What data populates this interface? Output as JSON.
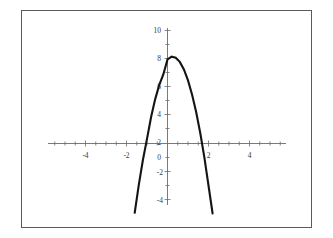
{
  "figure": {
    "background_color": "#ffffff",
    "frame_color": "#5a5a5a",
    "axis_color": "#6b6b6b",
    "curve_color": "#141414",
    "label_color": "#3a3a3a"
  },
  "chart_data": {
    "type": "line",
    "title": "",
    "subtitle": "",
    "xlabel": "",
    "ylabel": "",
    "grid": false,
    "legend": null,
    "legend_position": "none",
    "xlim": [
      -5.8,
      5.8
    ],
    "ylim": [
      -5.4,
      10.6
    ],
    "xticks": [
      -4,
      -2,
      2,
      4
    ],
    "xtick_labels": [
      "-4",
      "-2",
      "2",
      "4"
    ],
    "yticks": [
      -4,
      -2,
      2,
      4,
      6,
      8,
      10
    ],
    "ytick_labels": [
      "-4",
      "-2",
      "2",
      "4",
      "6",
      "8",
      "10"
    ],
    "origin_label": "0",
    "minor_ticks": true,
    "annotations": [],
    "series": [
      {
        "name": "parabola",
        "kind": "quadratic",
        "equation": "y = -3(x - 0.25)^2 + 6.2",
        "vertex": [
          0.25,
          6.2
        ],
        "x_intercepts": [
          -1.19,
          1.69
        ],
        "y_intercept": 6.01,
        "x_domain": [
          -1.6,
          2.2
        ],
        "y_range": [
          -5.0,
          6.2
        ],
        "x": [
          -1.6,
          -1.4,
          -1.2,
          -1.0,
          -0.8,
          -0.6,
          -0.4,
          -0.2,
          0.0,
          0.2,
          0.4,
          0.6,
          0.8,
          1.0,
          1.2,
          1.4,
          1.6,
          1.8,
          2.0,
          2.2
        ],
        "y": [
          -4.95,
          -2.96,
          -1.18,
          0.33,
          1.89,
          3.17,
          4.19,
          4.95,
          6.01,
          6.2,
          6.13,
          5.83,
          5.29,
          4.51,
          3.49,
          2.23,
          0.73,
          -1.01,
          -3.0,
          -5.0
        ]
      }
    ]
  },
  "tick_labels": {
    "y_10": "10",
    "y_8": "8",
    "y_6": "6",
    "y_4": "4",
    "y_2": "2",
    "y_0": "0",
    "y_neg2": "-2",
    "y_neg4": "-4",
    "x_neg4": "-4",
    "x_neg2": "-2",
    "x_2": "2",
    "x_4": "4"
  }
}
